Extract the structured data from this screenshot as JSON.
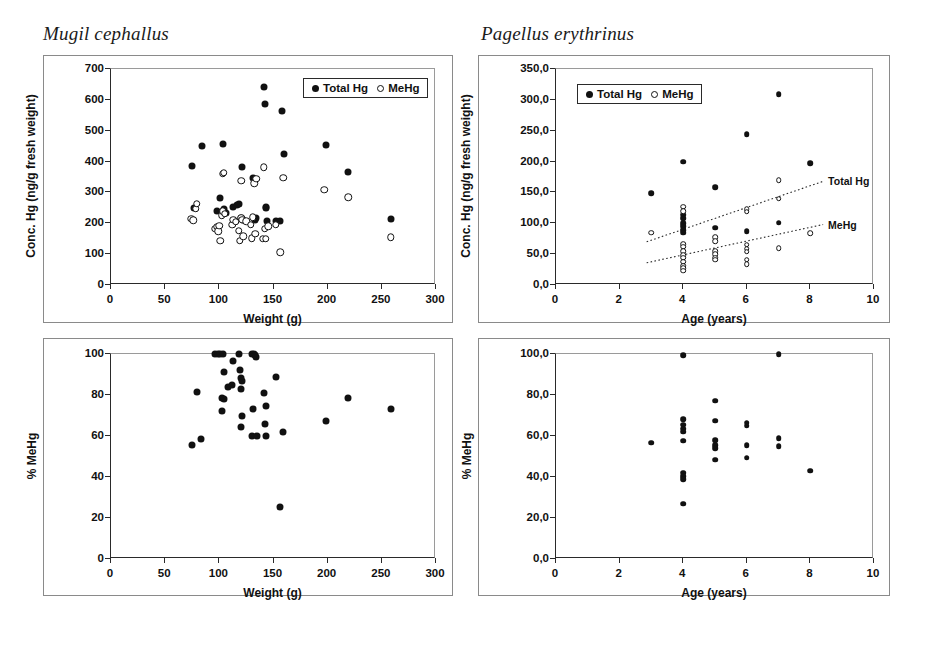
{
  "figure": {
    "width": 926,
    "height": 653,
    "background": "#ffffff",
    "marker_color": "#111111",
    "axis_color": "#2a2a2a",
    "frame_color": "#8a8a8a"
  },
  "titles": {
    "left_species": "Mugil cephallus",
    "right_species": "Pagellus erythrinus"
  },
  "legend": {
    "total_hg": "Total Hg",
    "mehg": "MeHg"
  },
  "axis_titles": {
    "weight": "Weight (g)",
    "age": "Age (years)",
    "conc_hg": "Conc. Hg (ng/g fresh weight)",
    "pct_mehg": "% MeHg"
  },
  "chart_data": [
    {
      "id": "mugil-conc-vs-weight",
      "panel": "top-left",
      "type": "scatter",
      "title": "Mugil cephallus",
      "xlabel": "Weight (g)",
      "ylabel": "Conc. Hg (ng/g fresh weight)",
      "xlim": [
        0,
        300
      ],
      "ylim": [
        0,
        700
      ],
      "xticks": [
        0,
        50,
        100,
        150,
        200,
        250,
        300
      ],
      "yticks": [
        0,
        100,
        200,
        300,
        400,
        500,
        600,
        700
      ],
      "xtick_labels": [
        "0",
        "50",
        "100",
        "150",
        "200",
        "250",
        "300"
      ],
      "ytick_labels": [
        "0",
        "100",
        "200",
        "300",
        "400",
        "500",
        "600",
        "700"
      ],
      "grid": false,
      "legend_position": "top-right",
      "series": [
        {
          "name": "Total Hg",
          "marker": "filled-circle",
          "points": [
            [
              75,
              386
            ],
            [
              77,
              251
            ],
            [
              84,
              452
            ],
            [
              98,
              240
            ],
            [
              101,
              282
            ],
            [
              103,
              457
            ],
            [
              104,
              246
            ],
            [
              106,
              232
            ],
            [
              113,
              253
            ],
            [
              116,
              258
            ],
            [
              118,
              262
            ],
            [
              120,
              218
            ],
            [
              121,
              382
            ],
            [
              122,
              212
            ],
            [
              131,
              346
            ],
            [
              133,
              212
            ],
            [
              134,
              216
            ],
            [
              141,
              641
            ],
            [
              142,
              588
            ],
            [
              143,
              252
            ],
            [
              143,
              248
            ],
            [
              144,
              208
            ],
            [
              152,
              206
            ],
            [
              156,
              208
            ],
            [
              158,
              563
            ],
            [
              160,
              424
            ],
            [
              198,
              453
            ],
            [
              219,
              366
            ],
            [
              258,
              214
            ]
          ]
        },
        {
          "name": "MeHg",
          "marker": "open-circle",
          "points": [
            [
              74,
              215
            ],
            [
              76,
              210
            ],
            [
              78,
              247
            ],
            [
              79,
              263
            ],
            [
              96,
              183
            ],
            [
              98,
              188
            ],
            [
              99,
              174
            ],
            [
              100,
              192
            ],
            [
              101,
              144
            ],
            [
              102,
              226
            ],
            [
              103,
              239
            ],
            [
              103,
              360
            ],
            [
              104,
              363
            ],
            [
              105,
              231
            ],
            [
              112,
              196
            ],
            [
              113,
              212
            ],
            [
              115,
              205
            ],
            [
              118,
              176
            ],
            [
              119,
              144
            ],
            [
              120,
              338
            ],
            [
              120,
              218
            ],
            [
              121,
              212
            ],
            [
              122,
              158
            ],
            [
              125,
              206
            ],
            [
              129,
              196
            ],
            [
              130,
              152
            ],
            [
              131,
              220
            ],
            [
              132,
              330
            ],
            [
              133,
              166
            ],
            [
              134,
              345
            ],
            [
              140,
              150
            ],
            [
              141,
              382
            ],
            [
              142,
              182
            ],
            [
              143,
              150
            ],
            [
              145,
              190
            ],
            [
              152,
              196
            ],
            [
              156,
              106
            ],
            [
              159,
              347
            ],
            [
              197,
              308
            ],
            [
              219,
              285
            ],
            [
              258,
              154
            ]
          ]
        }
      ]
    },
    {
      "id": "pagellus-conc-vs-age",
      "panel": "top-right",
      "type": "scatter",
      "title": "Pagellus erythrinus",
      "xlabel": "Age (years)",
      "ylabel": "Conc. Hg (ng/g fresh weight)",
      "xlim": [
        0,
        10
      ],
      "ylim": [
        0,
        350
      ],
      "xticks": [
        0,
        2,
        4,
        6,
        8,
        10
      ],
      "yticks": [
        0,
        50,
        100,
        150,
        200,
        250,
        300,
        350
      ],
      "xtick_labels": [
        "0",
        "2",
        "4",
        "6",
        "8",
        "10"
      ],
      "ytick_labels": [
        "0,0",
        "50,0",
        "100,0",
        "150,0",
        "200,0",
        "250,0",
        "300,0",
        "350,0"
      ],
      "grid": false,
      "legend_position": "top-left",
      "series": [
        {
          "name": "Total Hg",
          "marker": "filled-circle",
          "points": [
            [
              3.0,
              149
            ],
            [
              4.0,
              200
            ],
            [
              4.0,
              114
            ],
            [
              4.0,
              108
            ],
            [
              4.0,
              100
            ],
            [
              4.0,
              95
            ],
            [
              4.0,
              89
            ],
            [
              4.0,
              85
            ],
            [
              5.0,
              158
            ],
            [
              5.0,
              93
            ],
            [
              6.0,
              244
            ],
            [
              6.0,
              87
            ],
            [
              7.0,
              309
            ],
            [
              7.0,
              101
            ],
            [
              8.0,
              197
            ]
          ]
        },
        {
          "name": "MeHg",
          "marker": "open-circle",
          "points": [
            [
              3.0,
              85
            ],
            [
              4.0,
              127
            ],
            [
              4.0,
              120
            ],
            [
              4.0,
              66
            ],
            [
              4.0,
              62
            ],
            [
              4.0,
              55
            ],
            [
              4.0,
              48
            ],
            [
              4.0,
              44
            ],
            [
              4.0,
              38
            ],
            [
              4.0,
              31
            ],
            [
              4.0,
              27
            ],
            [
              4.0,
              23
            ],
            [
              5.0,
              77
            ],
            [
              5.0,
              71
            ],
            [
              5.0,
              55
            ],
            [
              5.0,
              50
            ],
            [
              5.0,
              44
            ],
            [
              5.0,
              41
            ],
            [
              6.0,
              123
            ],
            [
              6.0,
              119
            ],
            [
              6.0,
              65
            ],
            [
              6.0,
              59
            ],
            [
              6.0,
              54
            ],
            [
              6.0,
              41
            ],
            [
              6.0,
              34
            ],
            [
              7.0,
              170
            ],
            [
              7.0,
              140
            ],
            [
              7.0,
              60
            ],
            [
              8.0,
              84
            ]
          ]
        }
      ],
      "trend_lines": [
        {
          "label": "Total Hg",
          "style": "dotted",
          "x_start": 2.85,
          "y_start": 70,
          "x_end": 8.4,
          "y_end": 168
        },
        {
          "label": "MeHg",
          "style": "dotted",
          "x_start": 2.85,
          "y_start": 36,
          "x_end": 8.4,
          "y_end": 98
        }
      ]
    },
    {
      "id": "mugil-pct-mehg-vs-weight",
      "panel": "bottom-left",
      "type": "scatter",
      "title": "Mugil cephallus",
      "xlabel": "Weight (g)",
      "ylabel": "% MeHg",
      "xlim": [
        0,
        300
      ],
      "ylim": [
        0,
        100
      ],
      "xticks": [
        0,
        50,
        100,
        150,
        200,
        250,
        300
      ],
      "yticks": [
        0,
        20,
        40,
        60,
        80,
        100
      ],
      "xtick_labels": [
        "0",
        "50",
        "100",
        "150",
        "200",
        "250",
        "300"
      ],
      "ytick_labels": [
        "0",
        "20",
        "40",
        "60",
        "80",
        "100"
      ],
      "grid": false,
      "legend_position": "none",
      "series": [
        {
          "name": "% MeHg",
          "marker": "filled-circle",
          "points": [
            [
              75,
              55.8
            ],
            [
              83,
              58.4
            ],
            [
              79,
              81.5
            ],
            [
              96,
              100
            ],
            [
              99,
              100
            ],
            [
              101,
              100
            ],
            [
              103,
              100
            ],
            [
              104,
              91
            ],
            [
              102,
              78.5
            ],
            [
              104,
              78.0
            ],
            [
              102,
              72.0
            ],
            [
              108,
              84.0
            ],
            [
              112,
              85.0
            ],
            [
              113,
              96.5
            ],
            [
              118,
              100
            ],
            [
              119,
              92.0
            ],
            [
              120,
              88.5
            ],
            [
              121,
              87.0
            ],
            [
              120,
              83.0
            ],
            [
              121,
              70.0
            ],
            [
              120,
              64.5
            ],
            [
              130,
              100
            ],
            [
              132,
              100
            ],
            [
              133,
              99.5
            ],
            [
              134,
              98.5
            ],
            [
              131,
              73.0
            ],
            [
              130,
              59.8
            ],
            [
              135,
              59.8
            ],
            [
              141,
              81.0
            ],
            [
              143,
              74.5
            ],
            [
              142,
              66.0
            ],
            [
              143,
              59.8
            ],
            [
              152,
              89.0
            ],
            [
              159,
              61.8
            ],
            [
              156,
              25.2
            ],
            [
              198,
              67.5
            ],
            [
              219,
              78.5
            ],
            [
              258,
              73.0
            ]
          ]
        }
      ]
    },
    {
      "id": "pagellus-pct-mehg-vs-age",
      "panel": "bottom-right",
      "type": "scatter",
      "title": "Pagellus erythrinus",
      "xlabel": "Age (years)",
      "ylabel": "% MeHg",
      "xlim": [
        0,
        10
      ],
      "ylim": [
        0,
        100
      ],
      "xticks": [
        0,
        2,
        4,
        6,
        8,
        10
      ],
      "yticks": [
        0,
        20,
        40,
        60,
        80,
        100
      ],
      "xtick_labels": [
        "0",
        "2",
        "4",
        "6",
        "8",
        "10"
      ],
      "ytick_labels": [
        "0,0",
        "20,0",
        "40,0",
        "60,0",
        "80,0",
        "100,0"
      ],
      "grid": false,
      "legend_position": "none",
      "series": [
        {
          "name": "% MeHg",
          "marker": "filled-circle",
          "points": [
            [
              3.0,
              56.8
            ],
            [
              4.0,
              99.5
            ],
            [
              4.0,
              68.2
            ],
            [
              4.0,
              65.5
            ],
            [
              4.0,
              63.5
            ],
            [
              4.0,
              62.0
            ],
            [
              4.0,
              57.8
            ],
            [
              4.0,
              42.0
            ],
            [
              4.0,
              40.5
            ],
            [
              4.0,
              39.0
            ],
            [
              4.0,
              27.0
            ],
            [
              5.0,
              77.2
            ],
            [
              5.0,
              67.5
            ],
            [
              5.0,
              58.0
            ],
            [
              5.0,
              55.5
            ],
            [
              5.0,
              54.0
            ],
            [
              5.0,
              48.5
            ],
            [
              6.0,
              66.5
            ],
            [
              6.0,
              65.0
            ],
            [
              6.0,
              55.5
            ],
            [
              6.0,
              49.5
            ],
            [
              7.0,
              100
            ],
            [
              7.0,
              59.0
            ],
            [
              7.0,
              55.0
            ],
            [
              8.0,
              43.0
            ]
          ]
        }
      ]
    }
  ]
}
